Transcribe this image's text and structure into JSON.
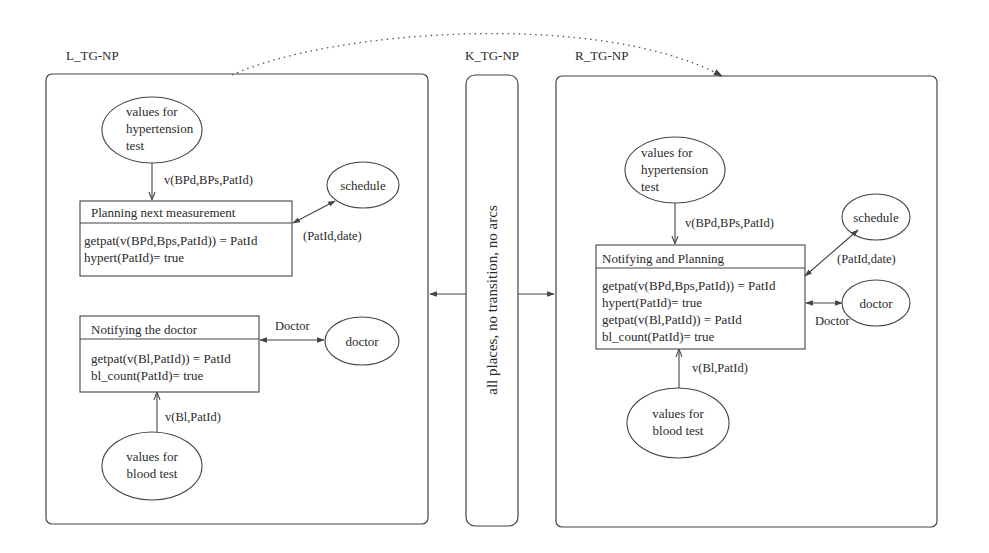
{
  "diagram": {
    "type": "graph-transformation-rule",
    "connector_label": "",
    "left": {
      "title": "L_TG-NP",
      "places": {
        "hypertension": [
          "values for",
          "hypertension",
          "test"
        ],
        "schedule": "schedule",
        "doctor": "doctor",
        "blood": [
          "values for",
          "blood test"
        ]
      },
      "transitions": {
        "planning": {
          "name": "Planning next measurement",
          "guards": [
            "getpat(v(BPd,Bps,PatId)) = PatId",
            "hypert(PatId)= true"
          ]
        },
        "notifying": {
          "name": "Notifying the doctor",
          "guards": [
            "getpat(v(Bl,PatId)) = PatId",
            "bl_count(PatId)= true"
          ]
        }
      },
      "arcs": {
        "hyper_to_planning": "v(BPd,BPs,PatId)",
        "planning_schedule": "(PatId,date)",
        "notifying_doctor": "Doctor",
        "blood_to_notifying": "v(Bl,PatId)"
      }
    },
    "kernel": {
      "title": "K_TG-NP",
      "text": "all places, no transition, no arcs"
    },
    "right": {
      "title": "R_TG-NP",
      "places": {
        "hypertension": [
          "values for",
          "hypertension",
          "test"
        ],
        "schedule": "schedule",
        "doctor": "doctor",
        "blood": [
          "values for",
          "blood test"
        ]
      },
      "transitions": {
        "combined": {
          "name": "Notifying and Planning",
          "guards": [
            "getpat(v(BPd,Bps,PatId)) = PatId",
            "hypert(PatId)= true",
            "getpat(v(Bl,PatId)) = PatId",
            "bl_count(PatId)= true"
          ]
        }
      },
      "arcs": {
        "hyper_to_combined": "v(BPd,BPs,PatId)",
        "combined_schedule": "(PatId,date)",
        "combined_doctor": "Doctor",
        "blood_to_combined": "v(Bl,PatId)"
      }
    },
    "colors": {
      "stroke": "#444444",
      "text": "#2a2a2a",
      "background": "#ffffff"
    }
  }
}
